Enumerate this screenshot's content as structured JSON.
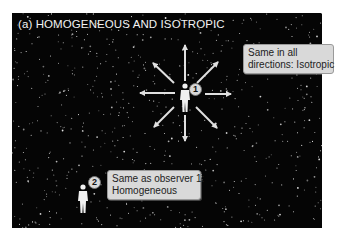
{
  "figure": {
    "title": "(a)  HOMOGENEOUS AND ISOTROPIC",
    "background_color": "#050505",
    "star_color": "#e6e6e6",
    "arrow_color": "#e0e0e0",
    "observers": [
      {
        "number": "1",
        "label_line1": "Same in all",
        "label_line2": "directions: Isotropic",
        "arrow_directions": [
          "up",
          "up-right",
          "right",
          "down-right",
          "down",
          "down-left",
          "left",
          "up-left"
        ]
      },
      {
        "number": "2",
        "label_line1": "Same as observer 1:",
        "label_line2": "Homogeneous"
      }
    ]
  }
}
